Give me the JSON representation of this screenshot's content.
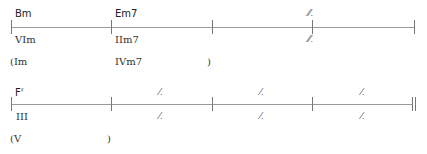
{
  "row1": {
    "chords": [
      "Bm",
      "Em7"
    ],
    "romans": [
      "VIm",
      "IIm7"
    ],
    "alt_romans": [
      "(Im",
      "IVm7",
      ")"
    ],
    "repeat_symbol_top": "𝄏",
    "repeat_symbol_bottom": "𝄏"
  },
  "row2": {
    "chord_root": "F",
    "chord_accidental": "♯",
    "roman": "III",
    "alt_romans": [
      "(V",
      ")"
    ],
    "repeat_symbols": [
      "𝄎",
      "𝄎",
      "𝄎",
      "𝄎",
      "𝄎",
      "𝄎"
    ]
  }
}
